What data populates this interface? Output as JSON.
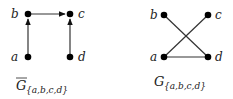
{
  "graphs": [
    {
      "id": "left",
      "caption_main": "G",
      "caption_sub": "{a,b,c,d}",
      "caption_overline": true,
      "directed": true,
      "nodes": [
        {
          "label": "a",
          "x": 28,
          "y": 57
        },
        {
          "label": "b",
          "x": 28,
          "y": 14
        },
        {
          "label": "c",
          "x": 70,
          "y": 14
        },
        {
          "label": "d",
          "x": 70,
          "y": 57
        }
      ],
      "edges": [
        {
          "from": "a",
          "to": "b"
        },
        {
          "from": "b",
          "to": "c"
        },
        {
          "from": "d",
          "to": "c"
        }
      ]
    },
    {
      "id": "right",
      "caption_main": "G",
      "caption_sub": "{a,b,c,d}",
      "caption_overline": false,
      "directed": false,
      "nodes": [
        {
          "label": "a",
          "x": 164,
          "y": 57
        },
        {
          "label": "b",
          "x": 164,
          "y": 15
        },
        {
          "label": "c",
          "x": 208,
          "y": 15
        },
        {
          "label": "d",
          "x": 208,
          "y": 57
        }
      ],
      "edges": [
        {
          "from": "b",
          "to": "d"
        },
        {
          "from": "c",
          "to": "a"
        },
        {
          "from": "a",
          "to": "d"
        }
      ]
    }
  ]
}
